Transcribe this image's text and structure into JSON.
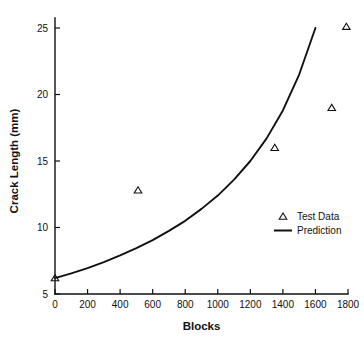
{
  "chart_data": {
    "type": "scatter",
    "title": "",
    "subtitle": "",
    "xlabel": "Blocks",
    "ylabel": "Crack Length (mm)",
    "xlim": [
      0,
      1800
    ],
    "ylim": [
      5,
      25
    ],
    "grid": false,
    "legend_position": "center-right",
    "x_ticks": [
      0,
      200,
      400,
      600,
      800,
      1000,
      1200,
      1400,
      1600,
      1800
    ],
    "x_tick_labels": [
      "0",
      "200",
      "400",
      "600",
      "800",
      "1000",
      "1200",
      "1400",
      "1600",
      "1800"
    ],
    "y_ticks": [
      5,
      10,
      15,
      20,
      25
    ],
    "y_tick_labels": [
      "5",
      "10",
      "15",
      "20",
      "25"
    ],
    "series": [
      {
        "name": "Test Data",
        "type": "scatter",
        "marker": "triangle-open",
        "color": "#111111",
        "points": [
          {
            "x": 0,
            "y": 6.2
          },
          {
            "x": 510,
            "y": 12.8
          },
          {
            "x": 1350,
            "y": 16.0
          },
          {
            "x": 1700,
            "y": 19.0
          },
          {
            "x": 1790,
            "y": 25.1
          }
        ]
      },
      {
        "name": "Prediction",
        "type": "line",
        "color": "#111111",
        "points": [
          {
            "x": 0,
            "y": 6.2
          },
          {
            "x": 100,
            "y": 6.55
          },
          {
            "x": 200,
            "y": 6.95
          },
          {
            "x": 300,
            "y": 7.4
          },
          {
            "x": 400,
            "y": 7.9
          },
          {
            "x": 500,
            "y": 8.45
          },
          {
            "x": 600,
            "y": 9.05
          },
          {
            "x": 700,
            "y": 9.75
          },
          {
            "x": 800,
            "y": 10.5
          },
          {
            "x": 900,
            "y": 11.4
          },
          {
            "x": 1000,
            "y": 12.4
          },
          {
            "x": 1100,
            "y": 13.6
          },
          {
            "x": 1200,
            "y": 15.0
          },
          {
            "x": 1300,
            "y": 16.7
          },
          {
            "x": 1400,
            "y": 18.8
          },
          {
            "x": 1500,
            "y": 21.5
          },
          {
            "x": 1600,
            "y": 25.0
          }
        ]
      }
    ]
  },
  "legend": {
    "entries": [
      {
        "label": "Test Data",
        "marker": "triangle-open"
      },
      {
        "label": "Prediction",
        "marker": "line"
      }
    ]
  },
  "axes": {
    "x_title": "Blocks",
    "y_title": "Crack Length (mm)"
  }
}
